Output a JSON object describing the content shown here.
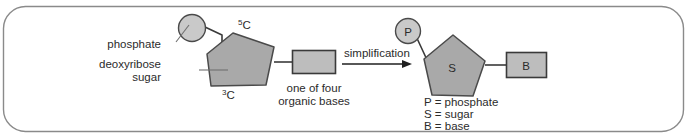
{
  "figure": {
    "title_present": false,
    "background_color": "#ffffff",
    "border_color": "#8a8a8a",
    "border_radius": 22
  },
  "palette": {
    "phosphate_fill": "#c9c9c9",
    "sugar_fill": "#a9a9a9",
    "base_fill": "#bdbdbd",
    "shape_stroke": "#4a4a4a",
    "bond_stroke": "#3a3a3a",
    "leader_stroke": "#6f6f6f",
    "text_color": "#2b2b2b"
  },
  "left_panel": {
    "name": "detailed-nucleotide-structure",
    "phosphate": {
      "label": "phosphate",
      "shape": "circle"
    },
    "sugar": {
      "label_line1": "deoxyribose",
      "label_line2": "sugar",
      "shape": "pentagon",
      "carbon_top": "5C",
      "carbon_top_superscript": "5",
      "carbon_top_letter": "C",
      "carbon_bottom": "3C",
      "carbon_bottom_superscript": "3",
      "carbon_bottom_letter": "C"
    },
    "base": {
      "label_line1": "one of four",
      "label_line2": "organic bases",
      "shape": "rectangle"
    }
  },
  "arrow": {
    "label": "simplification",
    "direction": "right"
  },
  "right_panel": {
    "name": "simplified-nucleotide-structure",
    "phosphate_symbol": "P",
    "sugar_symbol": "S",
    "base_symbol": "B",
    "legend": [
      "P = phosphate",
      "S = sugar",
      "B = base"
    ]
  }
}
